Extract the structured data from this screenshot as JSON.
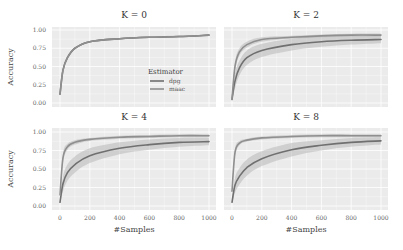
{
  "chart_data": {
    "type": "line",
    "layout": "2x2 facet grid",
    "grid": true,
    "legend": {
      "title": "Estimator",
      "entries": [
        "dpg",
        "maac"
      ],
      "position": "inside top-left panel, lower right"
    },
    "xlabel": "#Samples",
    "ylabel": "Accuracy",
    "xticks": [
      0,
      200,
      400,
      600,
      800,
      1000
    ],
    "yticks": [
      "0.00",
      "0.25",
      "0.50",
      "0.75",
      "1.00"
    ],
    "xlim": [
      0,
      1000
    ],
    "ylim": [
      0,
      1
    ],
    "colors": {
      "dpg": "#707070",
      "maac": "#8f8f8f",
      "band": "#b8b8b8",
      "panel_bg": "#ebebeb",
      "grid": "#ffffff"
    },
    "panels": [
      {
        "title": "K = 0",
        "x": [
          0,
          20,
          50,
          100,
          200,
          400,
          600,
          800,
          1000
        ],
        "series": [
          {
            "name": "dpg",
            "values": [
              0.12,
              0.45,
              0.62,
              0.75,
              0.84,
              0.88,
              0.9,
              0.91,
              0.93
            ],
            "band": [
              0.0,
              0.01,
              0.01,
              0.01,
              0.01,
              0.01,
              0.01,
              0.01,
              0.01
            ]
          },
          {
            "name": "maac",
            "values": [
              0.12,
              0.45,
              0.62,
              0.75,
              0.84,
              0.88,
              0.9,
              0.91,
              0.93
            ],
            "band": [
              0.0,
              0.01,
              0.01,
              0.01,
              0.01,
              0.01,
              0.01,
              0.01,
              0.01
            ]
          }
        ]
      },
      {
        "title": "K = 2",
        "x": [
          0,
          20,
          50,
          100,
          200,
          400,
          600,
          800,
          1000
        ],
        "series": [
          {
            "name": "dpg",
            "values": [
              0.05,
              0.3,
              0.48,
              0.62,
              0.72,
              0.8,
              0.84,
              0.86,
              0.87
            ],
            "band": [
              0.02,
              0.1,
              0.1,
              0.1,
              0.09,
              0.08,
              0.07,
              0.06,
              0.05
            ]
          },
          {
            "name": "maac",
            "values": [
              0.05,
              0.5,
              0.7,
              0.8,
              0.87,
              0.9,
              0.92,
              0.93,
              0.93
            ],
            "band": [
              0.02,
              0.06,
              0.05,
              0.04,
              0.03,
              0.02,
              0.02,
              0.02,
              0.02
            ]
          }
        ]
      },
      {
        "title": "K = 4",
        "x": [
          0,
          20,
          50,
          100,
          200,
          400,
          600,
          800,
          1000
        ],
        "series": [
          {
            "name": "dpg",
            "values": [
              0.05,
              0.3,
              0.45,
              0.56,
              0.68,
              0.78,
              0.83,
              0.86,
              0.87
            ],
            "band": [
              0.02,
              0.1,
              0.11,
              0.11,
              0.1,
              0.08,
              0.07,
              0.06,
              0.05
            ]
          },
          {
            "name": "maac",
            "values": [
              0.15,
              0.65,
              0.8,
              0.86,
              0.9,
              0.93,
              0.94,
              0.95,
              0.95
            ],
            "band": [
              0.03,
              0.06,
              0.04,
              0.03,
              0.02,
              0.02,
              0.02,
              0.02,
              0.02
            ]
          }
        ]
      },
      {
        "title": "K = 8",
        "x": [
          0,
          20,
          50,
          100,
          200,
          400,
          600,
          800,
          1000
        ],
        "series": [
          {
            "name": "dpg",
            "values": [
              0.05,
              0.28,
              0.4,
              0.52,
              0.64,
              0.76,
              0.82,
              0.86,
              0.88
            ],
            "band": [
              0.02,
              0.1,
              0.11,
              0.11,
              0.1,
              0.09,
              0.07,
              0.06,
              0.05
            ]
          },
          {
            "name": "maac",
            "values": [
              0.2,
              0.72,
              0.85,
              0.89,
              0.92,
              0.94,
              0.95,
              0.95,
              0.95
            ],
            "band": [
              0.03,
              0.05,
              0.03,
              0.02,
              0.02,
              0.02,
              0.02,
              0.02,
              0.02
            ]
          }
        ]
      }
    ]
  }
}
